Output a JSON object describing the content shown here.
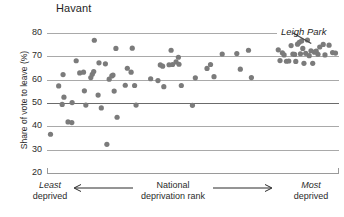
{
  "chart_data": {
    "type": "scatter",
    "title": "Havant",
    "xlabel": "National deprivation rank",
    "ylabel": "Share of vote to leave (%)",
    "ylim": [
      20,
      80
    ],
    "yticks": [
      20,
      30,
      40,
      50,
      60,
      70,
      80
    ],
    "grid": "horizontal",
    "legend": "none",
    "x_axis_left_label": "Least deprived",
    "x_axis_left_label_line1": "Least",
    "x_axis_left_label_line2": "deprived",
    "x_axis_right_label": "Most deprived",
    "x_axis_right_label_line1": "Most",
    "x_axis_right_label_line2": "deprived",
    "x_axis_center_label_line1": "National",
    "x_axis_center_label_line2": "deprivation rank",
    "x_direction_note": "Left arrow points to least deprived, right arrow points to most deprived",
    "annotations": [
      {
        "text": "Leigh Park",
        "target_description": "dense cluster of high-leave wards at the most-deprived end",
        "target_x": 0.905,
        "target_y": 75.5
      }
    ],
    "point_color": "#7b7b7b",
    "point_radius_px": 2.6,
    "x_note": "x values are normalised positions along the national deprivation rank axis (0 = least deprived, 1 = most deprived)",
    "points": [
      {
        "x": 0.012,
        "y": 36.6
      },
      {
        "x": 0.04,
        "y": 57.3
      },
      {
        "x": 0.055,
        "y": 62.2
      },
      {
        "x": 0.058,
        "y": 52.5
      },
      {
        "x": 0.052,
        "y": 49.4
      },
      {
        "x": 0.072,
        "y": 41.9
      },
      {
        "x": 0.085,
        "y": 41.6
      },
      {
        "x": 0.086,
        "y": 50.2
      },
      {
        "x": 0.1,
        "y": 68.1
      },
      {
        "x": 0.112,
        "y": 62.9
      },
      {
        "x": 0.125,
        "y": 63.2
      },
      {
        "x": 0.128,
        "y": 55.2
      },
      {
        "x": 0.133,
        "y": 49.1
      },
      {
        "x": 0.15,
        "y": 60.9
      },
      {
        "x": 0.155,
        "y": 62.3
      },
      {
        "x": 0.16,
        "y": 63.5
      },
      {
        "x": 0.162,
        "y": 76.9
      },
      {
        "x": 0.175,
        "y": 53.4
      },
      {
        "x": 0.178,
        "y": 67.2
      },
      {
        "x": 0.186,
        "y": 47.9
      },
      {
        "x": 0.2,
        "y": 66.8
      },
      {
        "x": 0.205,
        "y": 32.3
      },
      {
        "x": 0.213,
        "y": 60.2
      },
      {
        "x": 0.222,
        "y": 61.6
      },
      {
        "x": 0.226,
        "y": 62.0
      },
      {
        "x": 0.23,
        "y": 55.1
      },
      {
        "x": 0.236,
        "y": 73.4
      },
      {
        "x": 0.24,
        "y": 43.9
      },
      {
        "x": 0.268,
        "y": 57.6
      },
      {
        "x": 0.275,
        "y": 64.9
      },
      {
        "x": 0.288,
        "y": 63.2
      },
      {
        "x": 0.292,
        "y": 73.5
      },
      {
        "x": 0.3,
        "y": 57.5
      },
      {
        "x": 0.305,
        "y": 49.1
      },
      {
        "x": 0.355,
        "y": 60.4
      },
      {
        "x": 0.38,
        "y": 59.6
      },
      {
        "x": 0.388,
        "y": 66.3
      },
      {
        "x": 0.396,
        "y": 65.8
      },
      {
        "x": 0.4,
        "y": 57.0
      },
      {
        "x": 0.418,
        "y": 66.4
      },
      {
        "x": 0.425,
        "y": 72.6
      },
      {
        "x": 0.43,
        "y": 66.5
      },
      {
        "x": 0.442,
        "y": 67.6
      },
      {
        "x": 0.45,
        "y": 69.6
      },
      {
        "x": 0.452,
        "y": 66.6
      },
      {
        "x": 0.46,
        "y": 57.5
      },
      {
        "x": 0.498,
        "y": 49.0
      },
      {
        "x": 0.508,
        "y": 60.8
      },
      {
        "x": 0.548,
        "y": 64.8
      },
      {
        "x": 0.56,
        "y": 66.5
      },
      {
        "x": 0.572,
        "y": 61.3
      },
      {
        "x": 0.6,
        "y": 71.0
      },
      {
        "x": 0.65,
        "y": 71.2
      },
      {
        "x": 0.662,
        "y": 64.5
      },
      {
        "x": 0.69,
        "y": 72.6
      },
      {
        "x": 0.7,
        "y": 60.9
      },
      {
        "x": 0.792,
        "y": 72.8
      },
      {
        "x": 0.798,
        "y": 68.2
      },
      {
        "x": 0.806,
        "y": 71.5
      },
      {
        "x": 0.812,
        "y": 70.6
      },
      {
        "x": 0.82,
        "y": 67.9
      },
      {
        "x": 0.828,
        "y": 68.0
      },
      {
        "x": 0.836,
        "y": 74.6
      },
      {
        "x": 0.842,
        "y": 71.0
      },
      {
        "x": 0.848,
        "y": 70.8
      },
      {
        "x": 0.852,
        "y": 67.8
      },
      {
        "x": 0.858,
        "y": 75.2
      },
      {
        "x": 0.864,
        "y": 76.0
      },
      {
        "x": 0.868,
        "y": 71.1
      },
      {
        "x": 0.872,
        "y": 76.6
      },
      {
        "x": 0.876,
        "y": 73.4
      },
      {
        "x": 0.88,
        "y": 67.0
      },
      {
        "x": 0.886,
        "y": 71.3
      },
      {
        "x": 0.892,
        "y": 77.0
      },
      {
        "x": 0.898,
        "y": 70.3
      },
      {
        "x": 0.904,
        "y": 72.4
      },
      {
        "x": 0.91,
        "y": 67.0
      },
      {
        "x": 0.916,
        "y": 71.8
      },
      {
        "x": 0.922,
        "y": 72.2
      },
      {
        "x": 0.928,
        "y": 70.9
      },
      {
        "x": 0.934,
        "y": 74.0
      },
      {
        "x": 0.946,
        "y": 75.1
      },
      {
        "x": 0.952,
        "y": 70.6
      },
      {
        "x": 0.966,
        "y": 74.8
      },
      {
        "x": 0.978,
        "y": 71.6
      },
      {
        "x": 0.988,
        "y": 71.4
      }
    ]
  }
}
